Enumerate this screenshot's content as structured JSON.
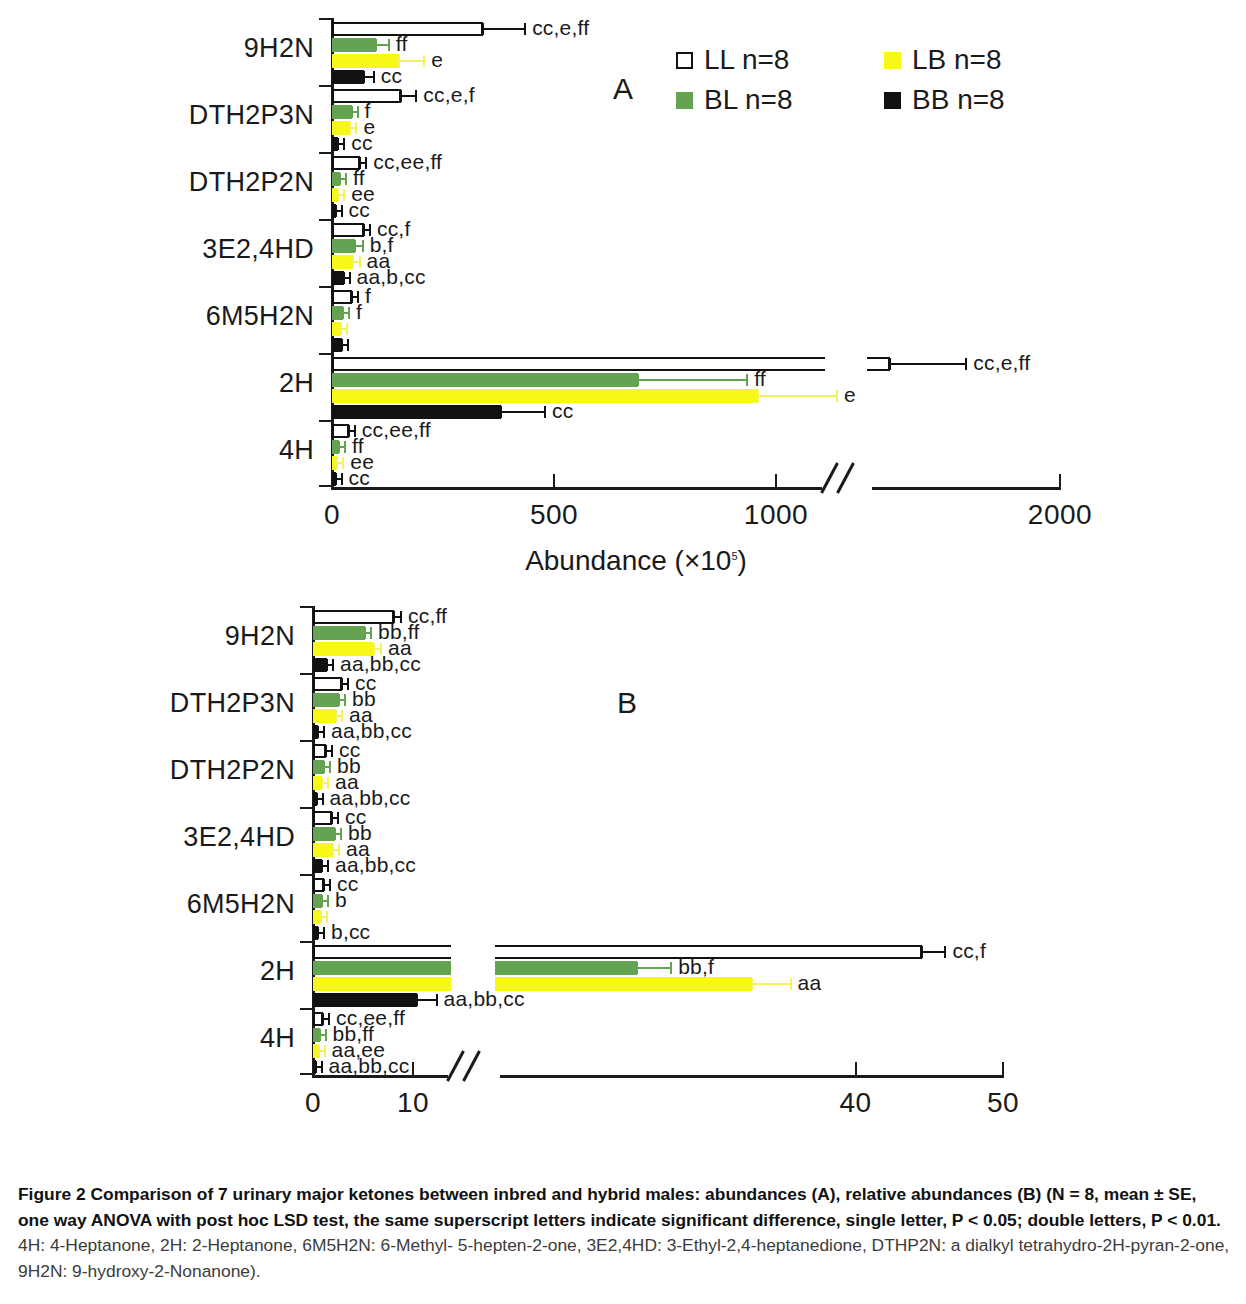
{
  "figure": {
    "caption_bold_1": "Figure 2 Comparison of 7 urinary major ketones between inbred and hybrid males: abundances (A), relative abundances (B) (N = 8, mean ± SE, one way ANOVA with post hoc LSD test, the same superscript letters indicate significant difference, single letter, P < 0.05; double letters, P < 0.01.",
    "caption_rest": " 4H: 4-Heptanone, 2H: 2-Heptanone, 6M5H2N: 6-Methyl- 5-hepten-2-one, 3E2,4HD: 3-Ethyl-2,4-heptanedione, DTHP2N: a dialkyl tetrahydro-2H-pyran-2-one, 9H2N: 9-hydroxy-2-Nonanone)."
  },
  "legend": {
    "items": [
      {
        "key": "LL",
        "label": "LL n=8",
        "color": "#ffffff"
      },
      {
        "key": "LB",
        "label": "LB n=8",
        "color": "#f7f718"
      },
      {
        "key": "BL",
        "label": "BL n=8",
        "color": "#63a352"
      },
      {
        "key": "BB",
        "label": "BB n=8",
        "color": "#111111"
      }
    ]
  },
  "colors": {
    "LL": "#ffffff",
    "BL": "#63a352",
    "LB": "#f7f718",
    "BB": "#111111",
    "axis": "#1a1a1a"
  },
  "chart_data": [
    {
      "id": "A",
      "type": "bar",
      "orientation": "horizontal",
      "panel_letter": "A",
      "title": "",
      "xlabel": "Abundance (×10⁵)",
      "xlabel_base": "Abundance (×10",
      "xlabel_exp": "5",
      "xlabel_tail": ")",
      "ylabel": "",
      "grid": false,
      "legend_position": "top-right",
      "xlim": [
        0,
        2000
      ],
      "axis_break": {
        "from": 1100,
        "to": 1500,
        "note": "// break between 1000 and 2000 ticks"
      },
      "xticks": [
        0,
        500,
        1000,
        2000
      ],
      "xticklabels": [
        "0",
        "500",
        "1000",
        "2000"
      ],
      "categories": [
        "9H2N",
        "DTH2P3N",
        "DTH2P2N",
        "3E2,4HD",
        "6M5H2N",
        "2H",
        "4H"
      ],
      "series": [
        {
          "name": "LL n=8",
          "key": "LL",
          "values": [
            340,
            155,
            62,
            72,
            45,
            1400,
            38
          ],
          "errors": [
            95,
            35,
            15,
            13,
            10,
            270,
            10
          ],
          "labels": [
            "cc,e,ff",
            "cc,e,f",
            "cc,ee,ff",
            "cc,f",
            "f",
            "cc,e,ff",
            "cc,ee,ff"
          ]
        },
        {
          "name": "BL n=8",
          "key": "BL",
          "values": [
            98,
            44,
            18,
            52,
            25,
            690,
            16
          ],
          "errors": [
            30,
            12,
            6,
            17,
            8,
            245,
            5
          ],
          "labels": [
            "ff",
            "f",
            "ff",
            "b,f",
            "f",
            "ff",
            "ff"
          ]
        },
        {
          "name": "LB n=8",
          "key": "LB",
          "values": [
            150,
            40,
            14,
            48,
            20,
            960,
            12
          ],
          "errors": [
            58,
            15,
            5,
            14,
            7,
            255,
            4
          ],
          "labels": [
            "e",
            "e",
            "ee",
            "aa",
            "",
            "e",
            "ee"
          ]
        },
        {
          "name": "BB n=8",
          "key": "BB",
          "values": [
            72,
            14,
            8,
            26,
            22,
            380,
            8
          ],
          "errors": [
            22,
            5,
            3,
            9,
            9,
            100,
            3
          ],
          "labels": [
            "cc",
            "cc",
            "cc",
            "aa,b,cc",
            "",
            "cc",
            "cc"
          ]
        }
      ]
    },
    {
      "id": "B",
      "type": "bar",
      "orientation": "horizontal",
      "panel_letter": "B",
      "title": "",
      "xlabel": "relative abundance (%)",
      "ylabel": "",
      "grid": false,
      "legend_position": "none",
      "xlim": [
        0,
        50
      ],
      "axis_break": {
        "from": 13,
        "to": 16.5,
        "note": "// break between 10 and 40 ticks"
      },
      "xticks": [
        0,
        10,
        40,
        50
      ],
      "xticklabels": [
        "0",
        "10",
        "40",
        "50"
      ],
      "categories": [
        "9H2N",
        "DTH2P3N",
        "DTH2P2N",
        "3E2,4HD",
        "6M5H2N",
        "2H",
        "4H"
      ],
      "series": [
        {
          "name": "LL n=8",
          "key": "LL",
          "values": [
            8.1,
            2.9,
            1.3,
            1.9,
            1.1,
            44.5,
            1.0
          ],
          "errors": [
            0.7,
            0.3,
            0.2,
            0.25,
            0.2,
            1.6,
            0.15
          ],
          "labels": [
            "cc,ff",
            "cc",
            "cc",
            "cc",
            "cc",
            "cc,f",
            "cc,ee,ff"
          ]
        },
        {
          "name": "BL n=8",
          "key": "BL",
          "values": [
            5.2,
            2.6,
            1.1,
            2.2,
            0.9,
            25.2,
            0.65
          ],
          "errors": [
            0.6,
            0.4,
            0.2,
            0.3,
            0.2,
            2.3,
            0.12
          ],
          "labels": [
            "bb,ff",
            "bb",
            "bb",
            "bb",
            "b",
            "bb,f",
            "bb,ff"
          ]
        },
        {
          "name": "LB n=8",
          "key": "LB",
          "values": [
            6.1,
            2.3,
            0.9,
            2.0,
            0.8,
            33.0,
            0.55
          ],
          "errors": [
            0.7,
            0.35,
            0.2,
            0.3,
            0.2,
            2.6,
            0.1
          ],
          "labels": [
            "aa",
            "aa",
            "aa",
            "aa",
            "",
            "aa",
            "aa,ee"
          ]
        },
        {
          "name": "BB n=8",
          "key": "BB",
          "values": [
            1.4,
            0.5,
            0.35,
            0.9,
            0.5,
            10.3,
            0.25
          ],
          "errors": [
            0.3,
            0.15,
            0.1,
            0.2,
            0.15,
            1.3,
            0.08
          ],
          "labels": [
            "aa,bb,cc",
            "aa,bb,cc",
            "aa,bb,cc",
            "aa,bb,cc",
            "b,cc",
            "aa,bb,cc",
            "aa,bb,cc"
          ]
        }
      ]
    }
  ]
}
